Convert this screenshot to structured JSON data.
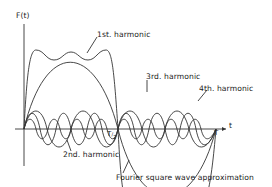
{
  "diagram": {
    "axis": {
      "y_label": "F(t)",
      "x_label": "t",
      "ticks": [
        {
          "label": "T/2",
          "num": "T",
          "den": "2"
        },
        {
          "label": "T"
        }
      ]
    },
    "labels": {
      "first": "1st. harmonic",
      "second": "2nd. harmonic",
      "third": "3rd. harmonic",
      "fourth": "4th. harmonic",
      "approx": "Fourier square wave approximation"
    },
    "colors": {
      "line": "#333333",
      "background": "#ffffff",
      "text": "#222222"
    }
  }
}
